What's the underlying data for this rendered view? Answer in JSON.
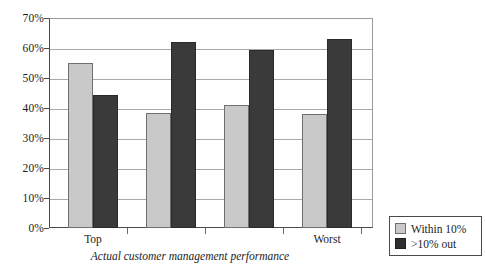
{
  "chart_data": {
    "type": "bar",
    "title": "",
    "xlabel": "Actual customer management performance",
    "ylabel": "",
    "categories": [
      "Top",
      "",
      "",
      "Worst"
    ],
    "series": [
      {
        "name": "Within 10%",
        "color": "#c9c9c9",
        "values": [
          55,
          38.5,
          41,
          38
        ]
      },
      {
        "name": ">10% out",
        "color": "#3a3a3a",
        "values": [
          44.5,
          62,
          59.5,
          63
        ]
      }
    ],
    "ylim": [
      0,
      70
    ],
    "ytick_labels": [
      "70%",
      "60%",
      "50%",
      "40%",
      "30%",
      "20%",
      "10%",
      "0%"
    ],
    "ytick_values": [
      70,
      60,
      50,
      40,
      30,
      20,
      10,
      0
    ],
    "grid": true,
    "legend_position": "right-bottom-outside"
  },
  "axis": {
    "y_labels": [
      "70%",
      "60%",
      "50%",
      "40%",
      "30%",
      "20%",
      "10%",
      "0%"
    ],
    "x_labels": [
      "Top",
      "Worst"
    ],
    "x_title": "Actual customer management performance"
  },
  "legend": {
    "items": [
      {
        "label": "Within 10%",
        "swatch": "light"
      },
      {
        "label": ">10% out",
        "swatch": "dark"
      }
    ]
  }
}
